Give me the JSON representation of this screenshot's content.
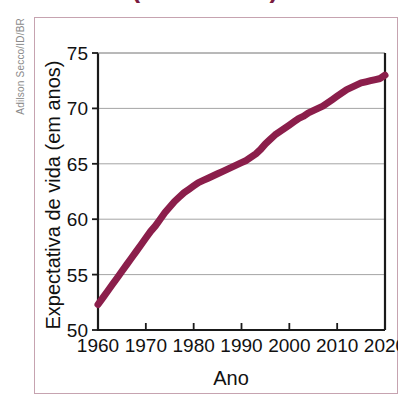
{
  "figure": {
    "title_partial": "(1960-2020)",
    "credit": "Adilson Secco/ID/BR",
    "frame_color": "#c6a3b0"
  },
  "chart_data": {
    "type": "line",
    "title": "(1960-2020)",
    "xlabel": "Ano",
    "ylabel": "Expectativa de vida (em anos)",
    "xlim": [
      1960,
      2020
    ],
    "ylim": [
      50,
      75
    ],
    "grid": true,
    "legend": "none",
    "line_color": "#8b1e4b",
    "line_width": 7,
    "xticks": [
      1960,
      1970,
      1980,
      1990,
      2000,
      2010,
      2020
    ],
    "xtick_labels": [
      "1960",
      "1970",
      "1980",
      "1990",
      "2000",
      "2010",
      "2020"
    ],
    "yticks": [
      50,
      55,
      60,
      65,
      70,
      75
    ],
    "ytick_labels": [
      "50",
      "55",
      "60",
      "65",
      "70",
      "75"
    ],
    "series": [
      {
        "name": "Expectativa de vida",
        "x": [
          1960,
          1961,
          1962,
          1963,
          1964,
          1965,
          1966,
          1967,
          1968,
          1969,
          1970,
          1971,
          1972,
          1973,
          1974,
          1975,
          1976,
          1977,
          1978,
          1979,
          1980,
          1981,
          1982,
          1983,
          1984,
          1985,
          1986,
          1987,
          1988,
          1989,
          1990,
          1991,
          1992,
          1993,
          1994,
          1995,
          1996,
          1997,
          1998,
          1999,
          2000,
          2001,
          2002,
          2003,
          2004,
          2005,
          2006,
          2007,
          2008,
          2009,
          2010,
          2011,
          2012,
          2013,
          2014,
          2015,
          2016,
          2017,
          2018,
          2019,
          2020
        ],
        "values": [
          52.3,
          52.9,
          53.5,
          54.1,
          54.7,
          55.3,
          55.9,
          56.5,
          57.1,
          57.7,
          58.3,
          58.9,
          59.4,
          60.0,
          60.6,
          61.1,
          61.6,
          62.0,
          62.4,
          62.7,
          63.0,
          63.3,
          63.5,
          63.7,
          63.9,
          64.1,
          64.3,
          64.5,
          64.7,
          64.9,
          65.1,
          65.3,
          65.6,
          65.9,
          66.3,
          66.8,
          67.2,
          67.6,
          67.9,
          68.2,
          68.5,
          68.8,
          69.1,
          69.3,
          69.6,
          69.8,
          70.0,
          70.2,
          70.5,
          70.8,
          71.1,
          71.4,
          71.7,
          71.9,
          72.1,
          72.3,
          72.4,
          72.5,
          72.6,
          72.7,
          73.0
        ]
      }
    ]
  }
}
